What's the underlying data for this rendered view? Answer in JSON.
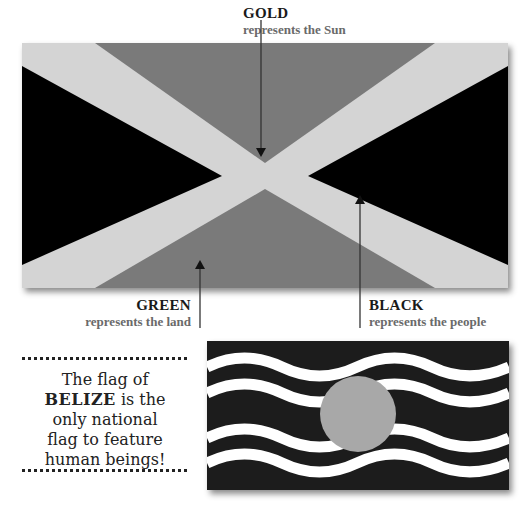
{
  "labels": {
    "gold": {
      "title": "GOLD",
      "subtitle": "represents the Sun"
    },
    "green": {
      "title": "GREEN",
      "subtitle": "represents the land"
    },
    "black": {
      "title": "BLACK",
      "subtitle": "represents the people"
    }
  },
  "fact": {
    "line1": "The flag of",
    "country": "BELIZE",
    "line2_rest": " is the",
    "line3": "only national",
    "line4": "flag to feature",
    "line5": "human beings!"
  },
  "colors": {
    "gold": "#d4d4d4",
    "green": "#7a7a7a",
    "black": "#000000",
    "belize_blue": "#1c1c1c",
    "belize_circle": "#a8a8a8",
    "belize_waves": "#ffffff"
  },
  "icons": {
    "arrow-down": "arrow pointing down to gold saltire",
    "arrow-up-green": "arrow pointing up to green triangle",
    "arrow-up-black": "arrow pointing up to black triangle"
  }
}
